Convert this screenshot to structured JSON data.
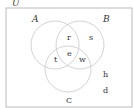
{
  "universe_label": "U",
  "sets": [
    {
      "name": "A",
      "cx": 55,
      "cy": 45,
      "r": 24
    },
    {
      "name": "B",
      "cx": 80,
      "cy": 45,
      "r": 24
    },
    {
      "name": "C",
      "cx": 68,
      "cy": 69,
      "r": 23
    }
  ],
  "elements": {
    "r": "r",
    "s": "s",
    "e": "e",
    "t": "t",
    "w": "w",
    "h": "h",
    "d": "d"
  },
  "labels": {
    "A": "A",
    "B": "B",
    "C": "C"
  },
  "colors": {
    "stroke": "#c8c8c8",
    "border": "#999999",
    "text": "#333333"
  }
}
